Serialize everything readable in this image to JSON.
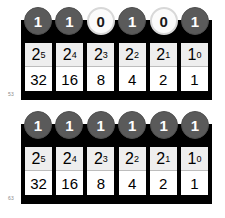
{
  "figure": {
    "background_color": "#ffffff",
    "panel_color": "#000000",
    "bit_on_color": "#5a5a5a",
    "bit_off_color": "#fbfbfb",
    "cell_power_color": "#eeeeee",
    "cell_value_color": "#ffffff"
  },
  "place_values": {
    "powers": [
      {
        "base": "2",
        "exponent": "5"
      },
      {
        "base": "2",
        "exponent": "4"
      },
      {
        "base": "2",
        "exponent": "3"
      },
      {
        "base": "2",
        "exponent": "2"
      },
      {
        "base": "2",
        "exponent": "1"
      },
      {
        "base": "1",
        "exponent": "0"
      }
    ],
    "decimals": [
      "32",
      "16",
      "8",
      "4",
      "2",
      "1"
    ]
  },
  "panels": [
    {
      "id": "panel-top",
      "caption": "53",
      "bits": [
        {
          "value": "1",
          "state": "on"
        },
        {
          "value": "1",
          "state": "on"
        },
        {
          "value": "0",
          "state": "off"
        },
        {
          "value": "1",
          "state": "on"
        },
        {
          "value": "0",
          "state": "off"
        },
        {
          "value": "1",
          "state": "on"
        }
      ]
    },
    {
      "id": "panel-bottom",
      "caption": "63",
      "bits": [
        {
          "value": "1",
          "state": "on"
        },
        {
          "value": "1",
          "state": "on"
        },
        {
          "value": "1",
          "state": "on"
        },
        {
          "value": "1",
          "state": "on"
        },
        {
          "value": "1",
          "state": "on"
        },
        {
          "value": "1",
          "state": "on"
        }
      ]
    }
  ]
}
